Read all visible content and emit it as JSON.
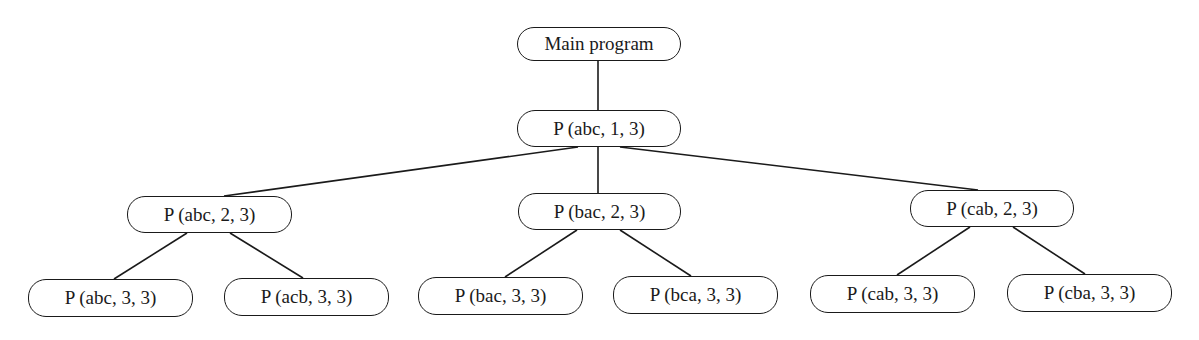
{
  "diagram": {
    "type": "recursion-tree",
    "nodes": [
      {
        "id": "main",
        "label": "Main program",
        "level": 0,
        "x": 517,
        "y": 27,
        "w": 164,
        "h": 34
      },
      {
        "id": "p_abc_1_3",
        "label": "P (abc, 1, 3)",
        "level": 1,
        "x": 517,
        "y": 110,
        "w": 164,
        "h": 37
      },
      {
        "id": "p_abc_2_3",
        "label": "P (abc, 2, 3)",
        "level": 2,
        "x": 127,
        "y": 196,
        "w": 165,
        "h": 37
      },
      {
        "id": "p_bac_2_3",
        "label": "P (bac, 2, 3)",
        "level": 2,
        "x": 518,
        "y": 193,
        "w": 163,
        "h": 37
      },
      {
        "id": "p_cab_2_3",
        "label": "P (cab, 2, 3)",
        "level": 2,
        "x": 910,
        "y": 190,
        "w": 164,
        "h": 37
      },
      {
        "id": "p_abc_3_3",
        "label": "P (abc, 3, 3)",
        "level": 3,
        "x": 28,
        "y": 279,
        "w": 165,
        "h": 38
      },
      {
        "id": "p_acb_3_3",
        "label": "P (acb, 3, 3)",
        "level": 3,
        "x": 224,
        "y": 278,
        "w": 165,
        "h": 38
      },
      {
        "id": "p_bac_3_3",
        "label": "P (bac, 3, 3)",
        "level": 3,
        "x": 418,
        "y": 277,
        "w": 165,
        "h": 38
      },
      {
        "id": "p_bca_3_3",
        "label": "P (bca, 3, 3)",
        "level": 3,
        "x": 613,
        "y": 276,
        "w": 165,
        "h": 38
      },
      {
        "id": "p_cab_3_3",
        "label": "P (cab, 3, 3)",
        "level": 3,
        "x": 810,
        "y": 275,
        "w": 165,
        "h": 38
      },
      {
        "id": "p_cba_3_3",
        "label": "P (cba, 3, 3)",
        "level": 3,
        "x": 1007,
        "y": 274,
        "w": 165,
        "h": 38
      }
    ],
    "edges": [
      {
        "from": "main",
        "to": "p_abc_1_3",
        "x1": 598,
        "y1": 61,
        "x2": 598,
        "y2": 110
      },
      {
        "from": "p_abc_1_3",
        "to": "p_abc_2_3",
        "x1": 578,
        "y1": 147,
        "x2": 224,
        "y2": 196
      },
      {
        "from": "p_abc_1_3",
        "to": "p_bac_2_3",
        "x1": 598,
        "y1": 147,
        "x2": 598,
        "y2": 193
      },
      {
        "from": "p_abc_1_3",
        "to": "p_cab_2_3",
        "x1": 620,
        "y1": 147,
        "x2": 978,
        "y2": 190
      },
      {
        "from": "p_abc_2_3",
        "to": "p_abc_3_3",
        "x1": 187,
        "y1": 233,
        "x2": 114,
        "y2": 279
      },
      {
        "from": "p_abc_2_3",
        "to": "p_acb_3_3",
        "x1": 230,
        "y1": 233,
        "x2": 303,
        "y2": 278
      },
      {
        "from": "p_bac_2_3",
        "to": "p_bac_3_3",
        "x1": 577,
        "y1": 230,
        "x2": 505,
        "y2": 277
      },
      {
        "from": "p_bac_2_3",
        "to": "p_bca_3_3",
        "x1": 620,
        "y1": 230,
        "x2": 691,
        "y2": 276
      },
      {
        "from": "p_cab_2_3",
        "to": "p_cab_3_3",
        "x1": 970,
        "y1": 227,
        "x2": 897,
        "y2": 275
      },
      {
        "from": "p_cab_2_3",
        "to": "p_cba_3_3",
        "x1": 1013,
        "y1": 227,
        "x2": 1085,
        "y2": 274
      }
    ]
  }
}
